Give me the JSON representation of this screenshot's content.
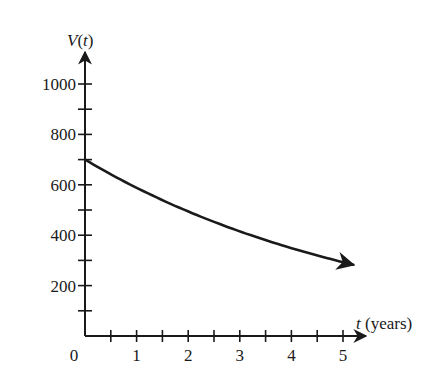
{
  "chart_data": {
    "type": "line",
    "title": "",
    "xlabel": "t (years)",
    "ylabel": "V(t)",
    "xlabel_var": "t",
    "xlabel_unit": "(years)",
    "ylabel_func": "V",
    "ylabel_arg": "t",
    "xlim": [
      0,
      5.2
    ],
    "ylim": [
      0,
      1050
    ],
    "x_ticks": [
      0.5,
      1,
      1.5,
      2,
      2.5,
      3,
      3.5,
      4,
      4.5,
      5
    ],
    "x_tick_labels": [
      {
        "value": 0,
        "label": "0"
      },
      {
        "value": 1,
        "label": "1"
      },
      {
        "value": 2,
        "label": "2"
      },
      {
        "value": 3,
        "label": "3"
      },
      {
        "value": 4,
        "label": "4"
      },
      {
        "value": 5,
        "label": "5"
      }
    ],
    "y_ticks": [
      100,
      200,
      300,
      400,
      500,
      600,
      700,
      800,
      900,
      1000
    ],
    "y_tick_labels": [
      {
        "value": 200,
        "label": "200"
      },
      {
        "value": 400,
        "label": "400"
      },
      {
        "value": 600,
        "label": "600"
      },
      {
        "value": 800,
        "label": "800"
      },
      {
        "value": 1000,
        "label": "1000"
      }
    ],
    "grid": false,
    "legend": null,
    "series": [
      {
        "name": "V(t)",
        "color": "#1a1a1a",
        "x": [
          0,
          1,
          2,
          3,
          4,
          5,
          5.2
        ],
        "values": [
          700,
          588,
          494,
          415,
          349,
          293,
          283
        ],
        "end_arrow": true
      }
    ]
  },
  "layout": {
    "origin_px": [
      85,
      336
    ],
    "px_per_x": 51.6,
    "px_per_y": 0.252,
    "x_axis_end_px": 366,
    "y_axis_end_px": 52
  }
}
